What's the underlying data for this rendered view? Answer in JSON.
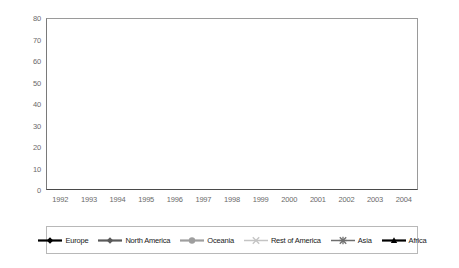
{
  "chart_data": {
    "type": "line",
    "title": "",
    "xlabel": "",
    "ylabel": "",
    "categories": [
      "1992",
      "1993",
      "1994",
      "1995",
      "1996",
      "1997",
      "1998",
      "1999",
      "2000",
      "2001",
      "2002",
      "2003",
      "2004"
    ],
    "x": [
      1992,
      1993,
      1994,
      1995,
      1996,
      1997,
      1998,
      1999,
      2000,
      2001,
      2002,
      2003,
      2004
    ],
    "ylim": [
      0,
      80
    ],
    "yticks": [
      0,
      10,
      20,
      30,
      40,
      50,
      60,
      70,
      80
    ],
    "grid": true,
    "legend_position": "bottom",
    "series": [
      {
        "name": "Europe",
        "color": "#000000",
        "marker": "diamond",
        "values": [
          1.0,
          1.3,
          2.0,
          3.0,
          5.2,
          8.0,
          13.5,
          23.0,
          36.5,
          45.5,
          51.5,
          56.5,
          71.5
        ]
      },
      {
        "name": "North America",
        "color": "#5a5a5a",
        "marker": "diamond",
        "values": [
          4.3,
          6.2,
          9.3,
          12.6,
          16.2,
          19.8,
          24.0,
          30.5,
          37.5,
          45.0,
          50.0,
          55.5,
          66.0
        ]
      },
      {
        "name": "Oceania",
        "color": "#9e9e9e",
        "marker": "circle",
        "values": [
          2.6,
          3.0,
          4.7,
          9.3,
          16.0,
          17.8,
          23.3,
          28.5,
          35.0,
          45.5,
          49.5,
          55.5,
          64.0
        ]
      },
      {
        "name": "Rest of America",
        "color": "#c4c4c4",
        "marker": "cross",
        "values": [
          0.5,
          0.7,
          1.0,
          1.4,
          1.8,
          2.4,
          3.6,
          5.6,
          8.5,
          12.5,
          16.5,
          21.5,
          30.8
        ]
      },
      {
        "name": "Asia",
        "color": "#6e6e6e",
        "marker": "asterisk",
        "values": [
          0.4,
          0.5,
          0.7,
          0.9,
          1.2,
          1.7,
          2.6,
          4.0,
          6.0,
          8.8,
          12.0,
          15.0,
          20.0
        ]
      },
      {
        "name": "Africa",
        "color": "#000000",
        "marker": "triangle",
        "values": [
          0.2,
          0.25,
          0.3,
          0.4,
          0.5,
          0.7,
          1.0,
          1.5,
          2.3,
          3.5,
          5.0,
          6.5,
          9.0
        ]
      }
    ]
  },
  "legend": {
    "items": [
      {
        "label": "Europe"
      },
      {
        "label": "North America"
      },
      {
        "label": "Oceania"
      },
      {
        "label": "Rest of America"
      },
      {
        "label": "Asia"
      },
      {
        "label": "Africa"
      }
    ]
  }
}
